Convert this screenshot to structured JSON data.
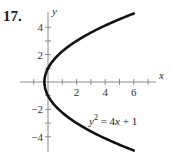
{
  "problem_number": "17.",
  "chart_data": {
    "type": "line",
    "title": "",
    "equation": "y² = 4x + 1",
    "equation_parts": {
      "lhs_var": "y",
      "lhs_exp": "2",
      "rhs": " = 4",
      "rhs_var": "x",
      "rhs_rest": " + 1"
    },
    "xlabel": "x",
    "ylabel": "y",
    "xlim": [
      -1.5,
      7.5
    ],
    "ylim": [
      -5,
      5.5
    ],
    "x_ticks": [
      -1,
      1,
      2,
      3,
      4,
      5,
      6,
      7
    ],
    "x_tick_labels": [
      "2",
      "4",
      "6"
    ],
    "x_tick_label_values": [
      2,
      4,
      6
    ],
    "y_ticks": [
      -4,
      -3,
      -2,
      -1,
      1,
      2,
      3,
      4
    ],
    "y_tick_labels": [
      "4",
      "2",
      "−2",
      "−4"
    ],
    "y_tick_label_values": [
      4,
      2,
      -2,
      -4
    ],
    "grid": false,
    "series": [
      {
        "name": "y^2 = 4x + 1",
        "x": [
          6,
          4,
          2,
          1,
          0.25,
          0,
          -0.25,
          0,
          0.25,
          1,
          2,
          4,
          6
        ],
        "y": [
          5,
          4.123,
          3,
          2.236,
          1.414,
          1,
          0,
          -1,
          -1.414,
          -2.236,
          -3,
          -4.123,
          -5
        ],
        "vertex": [
          -0.25,
          0
        ]
      }
    ],
    "colors": {
      "curve": "#111111",
      "axis": "#8a8a8a"
    }
  }
}
